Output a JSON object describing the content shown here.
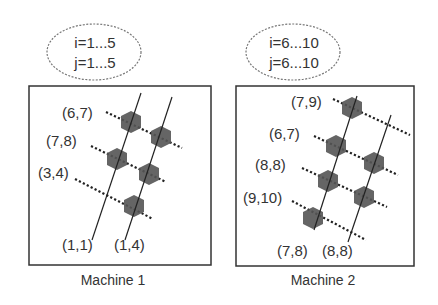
{
  "machines": [
    {
      "caption": "Machine 1",
      "range_i": "i=1...5",
      "range_j": "j=1...5",
      "labels": [
        {
          "text": "(6,7)",
          "x": 62,
          "y": 118
        },
        {
          "text": "(7,8)",
          "x": 46,
          "y": 146
        },
        {
          "text": "(3,4)",
          "x": 38,
          "y": 178
        },
        {
          "text": "(1,1)",
          "x": 62,
          "y": 250
        },
        {
          "text": "(1,4)",
          "x": 114,
          "y": 250
        }
      ]
    },
    {
      "caption": "Machine 2",
      "range_i": "i=6...10",
      "range_j": "j=6...10",
      "labels": [
        {
          "text": "(7,9)",
          "x": 291,
          "y": 107
        },
        {
          "text": "(6,7)",
          "x": 269,
          "y": 139
        },
        {
          "text": "(8,8)",
          "x": 255,
          "y": 170
        },
        {
          "text": "(9,10)",
          "x": 243,
          "y": 203
        },
        {
          "text": "(7,8)",
          "x": 277,
          "y": 256
        },
        {
          "text": "(8,8)",
          "x": 322,
          "y": 256
        }
      ]
    }
  ],
  "colors": {
    "hexagon": "#555555",
    "line": "#222222",
    "border": "#333333",
    "ellipse": "#777777"
  }
}
